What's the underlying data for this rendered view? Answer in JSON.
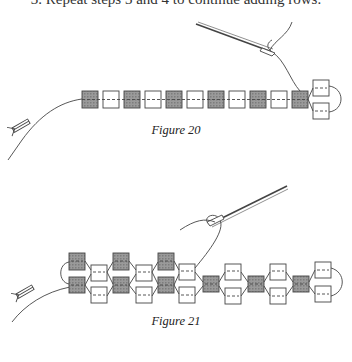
{
  "step": {
    "text": "3. Repeat steps 3 and 4 to continue adding rows."
  },
  "figures": [
    {
      "id": "figure-20",
      "caption": "Figure 20",
      "description": "Single row of beads strung on thread, alternating dark and light, ending with two stacked light beads and a thread loop; needle threaded above, stop bead at thread tail",
      "beads_in_row": 11,
      "pattern": [
        "dark",
        "light",
        "dark",
        "light",
        "dark",
        "light",
        "dark",
        "light",
        "dark",
        "light",
        "dark"
      ],
      "end_beads": [
        "light",
        "light"
      ]
    },
    {
      "id": "figure-21",
      "caption": "Figure 21",
      "description": "Multiple rows of beads joined in a lattice pattern with thread loops; needle threaded above, stop bead at thread tail"
    }
  ],
  "colors": {
    "dark_bead": "#8a8a8a",
    "light_bead": "#ffffff",
    "ink": "#333333"
  }
}
